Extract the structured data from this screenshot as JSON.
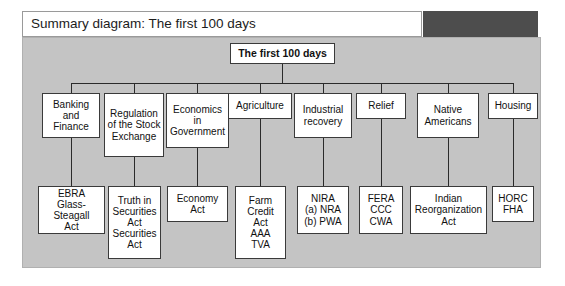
{
  "header": {
    "title": "Summary diagram: The first 100 days"
  },
  "diagram": {
    "root": {
      "label": "The first 100 days"
    },
    "columns": [
      {
        "topic": "Banking and Finance",
        "detail": "EBRA\nGlass-Steagall\nAct"
      },
      {
        "topic": "Regulation of the Stock Exchange",
        "detail": "Truth in\nSecurities\nAct\nSecurities\nAct"
      },
      {
        "topic": "Economics in Government",
        "detail": "Economy\nAct"
      },
      {
        "topic": "Agriculture",
        "detail": "Farm\nCredit\nAct\nAAA\nTVA"
      },
      {
        "topic": "Industrial recovery",
        "detail": "NIRA\n(a) NRA\n(b) PWA"
      },
      {
        "topic": "Relief",
        "detail": "FERA\nCCC\nCWA"
      },
      {
        "topic": "Native Americans",
        "detail": "Indian\nReorganization\nAct"
      },
      {
        "topic": "Housing",
        "detail": "HORC\nFHA"
      }
    ]
  },
  "colors": {
    "panel_background": "#c4c4c4",
    "header_dark_block": "#4d4d4d",
    "node_fill": "#ffffff",
    "line": "#2a2a2a",
    "text": "#111111"
  }
}
